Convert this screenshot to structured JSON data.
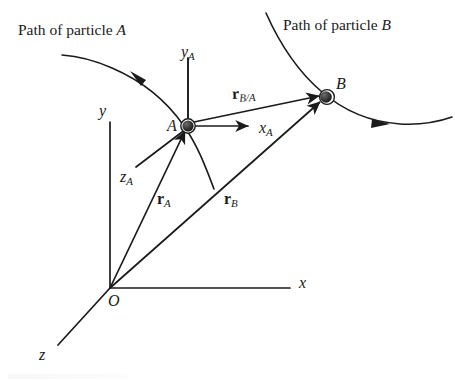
{
  "figure": {
    "width": 455,
    "height": 380,
    "background": "#ffffff",
    "ink_color": "#1a1a1a"
  },
  "labels": {
    "path_a_prefix": "Path of particle ",
    "path_a_letter": "A",
    "path_b_prefix": "Path of particle ",
    "path_b_letter": "B",
    "origin": "O",
    "axis_x": "x",
    "axis_y": "y",
    "axis_z": "z",
    "point_a": "A",
    "point_b": "B",
    "axis_xa": "x",
    "axis_xa_sub": "A",
    "axis_ya": "y",
    "axis_ya_sub": "A",
    "axis_za": "z",
    "axis_za_sub": "A",
    "vector_ra": "r",
    "vector_ra_sub": "A",
    "vector_rb": "r",
    "vector_rb_sub": "B",
    "vector_rba": "r",
    "vector_rba_sub": "B/A"
  },
  "geometry": {
    "origin": {
      "x": 110,
      "y": 288
    },
    "point_a": {
      "x": 188,
      "y": 125
    },
    "point_b": {
      "x": 327,
      "y": 97
    },
    "axis_x_end": {
      "x": 290,
      "y": 288
    },
    "axis_y_end": {
      "x": 110,
      "y": 122
    },
    "axis_z_end": {
      "x": 58,
      "y": 345
    },
    "axis_xa_end": {
      "x": 253,
      "y": 126
    },
    "axis_ya_end": {
      "x": 188,
      "y": 58
    },
    "axis_za_end": {
      "x": 135,
      "y": 168
    }
  },
  "colors": {
    "stroke": "#1a1a1a",
    "particle_fill": "#3a3a3a",
    "particle_edge": "#111111",
    "page": "#ffffff"
  }
}
